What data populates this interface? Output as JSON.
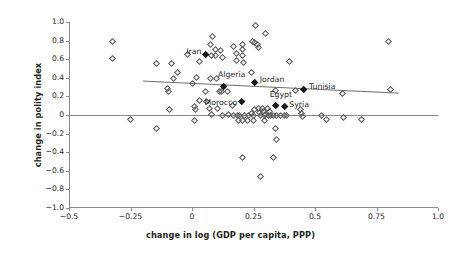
{
  "chart_data": {
    "type": "scatter",
    "title": "",
    "xlabel": "change in log (GDP per capita, PPP)",
    "ylabel": "change in polity index",
    "xlim": [
      -0.5,
      1.0
    ],
    "ylim": [
      -1.0,
      1.0
    ],
    "xticks": [
      "-0.5",
      "-0.25",
      "0",
      "0.25",
      "0.5",
      "0.75",
      "1.0"
    ],
    "xtick_values": [
      -0.5,
      -0.25,
      0,
      0.25,
      0.5,
      0.75,
      1.0
    ],
    "yticks": [
      "1.0",
      "0.8",
      "0.6",
      "0.4",
      "0.2",
      "0",
      "-0.2",
      "-0.4",
      "-0.6",
      "-0.8",
      "-1.0"
    ],
    "ytick_values": [
      1.0,
      0.8,
      0.6,
      0.4,
      0.2,
      0,
      -0.2,
      -0.4,
      -0.6,
      -0.8,
      -1.0
    ],
    "grid": false,
    "legend": "none",
    "zero_line_y": 0,
    "trend_line": {
      "x0": -0.2,
      "y0": 0.365,
      "x1": 0.84,
      "y1": 0.235
    },
    "highlighted_points": [
      {
        "label": "Iran",
        "x": 0.055,
        "y": 0.645,
        "label_dx": -24,
        "label_dy": -3
      },
      {
        "label": "Algeria",
        "x": 0.13,
        "y": 0.3,
        "label_dx": -6,
        "label_dy": -12
      },
      {
        "label": "Jordan",
        "x": 0.255,
        "y": 0.345,
        "label_dx": 5,
        "label_dy": -3
      },
      {
        "label": "Tunisia",
        "x": 0.455,
        "y": 0.27,
        "label_dx": 5,
        "label_dy": -3
      },
      {
        "label": "Morocco",
        "x": 0.2,
        "y": 0.14,
        "label_dx": -38,
        "label_dy": 1
      },
      {
        "label": "Egypt",
        "x": 0.34,
        "y": 0.095,
        "label_dx": -6,
        "label_dy": -11
      },
      {
        "label": "Syria",
        "x": 0.375,
        "y": 0.085,
        "label_dx": 5,
        "label_dy": -2
      }
    ],
    "points": [
      {
        "x": -0.325,
        "y": 0.795
      },
      {
        "x": -0.325,
        "y": 0.605
      },
      {
        "x": -0.145,
        "y": 0.555
      },
      {
        "x": -0.085,
        "y": 0.55
      },
      {
        "x": -0.075,
        "y": 0.395
      },
      {
        "x": -0.1,
        "y": 0.29
      },
      {
        "x": -0.095,
        "y": 0.255
      },
      {
        "x": -0.09,
        "y": 0.055
      },
      {
        "x": -0.25,
        "y": -0.05
      },
      {
        "x": -0.145,
        "y": -0.15
      },
      {
        "x": -0.06,
        "y": 0.455
      },
      {
        "x": -0.02,
        "y": 0.65
      },
      {
        "x": 0.0,
        "y": 0.34
      },
      {
        "x": 0.01,
        "y": 0.095
      },
      {
        "x": 0.015,
        "y": 0.055
      },
      {
        "x": 0.01,
        "y": -0.06
      },
      {
        "x": 0.03,
        "y": 0.58
      },
      {
        "x": 0.02,
        "y": 0.4
      },
      {
        "x": 0.03,
        "y": 0.16
      },
      {
        "x": 0.055,
        "y": 0.255
      },
      {
        "x": 0.08,
        "y": 0.645
      },
      {
        "x": 0.075,
        "y": 0.395
      },
      {
        "x": 0.085,
        "y": 0.845
      },
      {
        "x": 0.075,
        "y": 0.76
      },
      {
        "x": 0.095,
        "y": 0.7
      },
      {
        "x": 0.095,
        "y": 0.64
      },
      {
        "x": 0.115,
        "y": 0.69
      },
      {
        "x": 0.125,
        "y": 0.615
      },
      {
        "x": 0.06,
        "y": 0.14
      },
      {
        "x": 0.07,
        "y": 0.075
      },
      {
        "x": 0.08,
        "y": 0.005
      },
      {
        "x": 0.1,
        "y": 0.395
      },
      {
        "x": 0.11,
        "y": 0.25
      },
      {
        "x": 0.105,
        "y": 0.065
      },
      {
        "x": 0.125,
        "y": 0.0
      },
      {
        "x": 0.12,
        "y": 0.255
      },
      {
        "x": 0.15,
        "y": 0.005
      },
      {
        "x": 0.145,
        "y": 0.25
      },
      {
        "x": 0.165,
        "y": 0.105
      },
      {
        "x": 0.17,
        "y": 0.0
      },
      {
        "x": 0.185,
        "y": 0.0
      },
      {
        "x": 0.195,
        "y": 0.0
      },
      {
        "x": 0.17,
        "y": 0.74
      },
      {
        "x": 0.18,
        "y": 0.665
      },
      {
        "x": 0.18,
        "y": 0.59
      },
      {
        "x": 0.205,
        "y": 0.76
      },
      {
        "x": 0.205,
        "y": 0.7
      },
      {
        "x": 0.205,
        "y": 0.64
      },
      {
        "x": 0.21,
        "y": 0.56
      },
      {
        "x": 0.245,
        "y": 0.79
      },
      {
        "x": 0.255,
        "y": 0.775
      },
      {
        "x": 0.265,
        "y": 0.755
      },
      {
        "x": 0.27,
        "y": 0.725
      },
      {
        "x": 0.26,
        "y": 0.96
      },
      {
        "x": 0.24,
        "y": 0.455
      },
      {
        "x": 0.215,
        "y": 0.0
      },
      {
        "x": 0.23,
        "y": 0.0
      },
      {
        "x": 0.24,
        "y": 0.015
      },
      {
        "x": 0.25,
        "y": 0.0
      },
      {
        "x": 0.255,
        "y": 0.055
      },
      {
        "x": 0.27,
        "y": 0.065
      },
      {
        "x": 0.275,
        "y": 0.03
      },
      {
        "x": 0.28,
        "y": 0.0
      },
      {
        "x": 0.285,
        "y": 0.075
      },
      {
        "x": 0.29,
        "y": 0.04
      },
      {
        "x": 0.295,
        "y": 0.0
      },
      {
        "x": 0.3,
        "y": 0.01
      },
      {
        "x": 0.305,
        "y": 0.07
      },
      {
        "x": 0.31,
        "y": 0.0
      },
      {
        "x": 0.315,
        "y": 0.04
      },
      {
        "x": 0.32,
        "y": 0.0
      },
      {
        "x": 0.33,
        "y": 0.0
      },
      {
        "x": 0.345,
        "y": 0.0
      },
      {
        "x": 0.36,
        "y": 0.0
      },
      {
        "x": 0.375,
        "y": 0.0
      },
      {
        "x": 0.385,
        "y": 0.0
      },
      {
        "x": 0.225,
        "y": -0.055
      },
      {
        "x": 0.25,
        "y": -0.055
      },
      {
        "x": 0.295,
        "y": -0.06
      },
      {
        "x": 0.205,
        "y": -0.055
      },
      {
        "x": 0.19,
        "y": -0.055
      },
      {
        "x": 0.34,
        "y": -0.15
      },
      {
        "x": 0.345,
        "y": -0.265
      },
      {
        "x": 0.205,
        "y": -0.455
      },
      {
        "x": 0.28,
        "y": -0.66
      },
      {
        "x": 0.33,
        "y": -0.455
      },
      {
        "x": 0.395,
        "y": 0.575
      },
      {
        "x": 0.42,
        "y": 0.26
      },
      {
        "x": 0.34,
        "y": 0.26
      },
      {
        "x": 0.44,
        "y": 0.06
      },
      {
        "x": 0.445,
        "y": 0.02
      },
      {
        "x": 0.45,
        "y": -0.02
      },
      {
        "x": 0.525,
        "y": 0.0
      },
      {
        "x": 0.545,
        "y": -0.045
      },
      {
        "x": 0.61,
        "y": 0.235
      },
      {
        "x": 0.615,
        "y": -0.03
      },
      {
        "x": 0.69,
        "y": -0.05
      },
      {
        "x": 0.8,
        "y": 0.785
      },
      {
        "x": 0.805,
        "y": 0.27
      },
      {
        "x": 0.3,
        "y": 0.88
      }
    ]
  }
}
